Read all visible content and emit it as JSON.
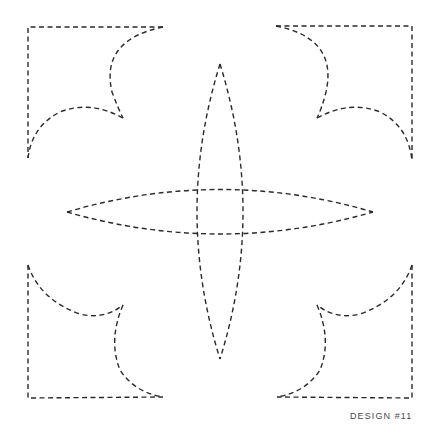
{
  "design": {
    "label": "DESIGN #11",
    "stroke_color": "#2a2a2a",
    "label_color": "#4a4a4a",
    "background": "#ffffff"
  },
  "shapes": {
    "corners": [
      {
        "name": "top-left",
        "corner": [
          28,
          27
        ]
      },
      {
        "name": "top-right",
        "corner": [
          412,
          26
        ]
      },
      {
        "name": "bottom-left",
        "corner": [
          28,
          398
        ]
      },
      {
        "name": "bottom-right",
        "corner": [
          412,
          398
        ]
      }
    ],
    "lenses": [
      {
        "name": "vertical",
        "tips": [
          [
            220,
            64
          ],
          [
            220,
            359
          ]
        ],
        "width_at_center": 46
      },
      {
        "name": "horizontal",
        "tips": [
          [
            67,
            212
          ],
          [
            373,
            212
          ]
        ],
        "height_at_center": 44
      }
    ]
  }
}
